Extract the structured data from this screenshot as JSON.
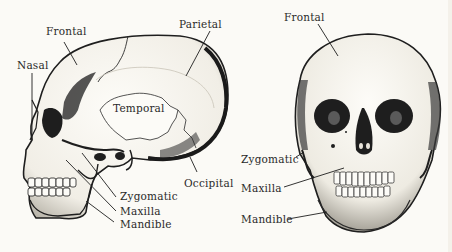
{
  "figure": {
    "type": "anatomical-diagram",
    "background_color": "#fbfaf6",
    "ink_color": "#1e1e1e"
  },
  "lateral_view": {
    "labels": [
      {
        "id": "frontal",
        "text": "Frontal"
      },
      {
        "id": "parietal",
        "text": "Parietal"
      },
      {
        "id": "nasal",
        "text": "Nasal"
      },
      {
        "id": "temporal",
        "text": "Temporal"
      },
      {
        "id": "occipital",
        "text": "Occipital"
      },
      {
        "id": "zygomatic",
        "text": "Zygomatic"
      },
      {
        "id": "maxilla",
        "text": "Maxilla"
      },
      {
        "id": "mandible",
        "text": "Mandible"
      }
    ]
  },
  "frontal_view": {
    "labels": [
      {
        "id": "frontal",
        "text": "Frontal"
      },
      {
        "id": "zygomatic",
        "text": "Zygomatic"
      },
      {
        "id": "maxilla",
        "text": "Maxilla"
      },
      {
        "id": "mandible",
        "text": "Mandible"
      }
    ]
  }
}
